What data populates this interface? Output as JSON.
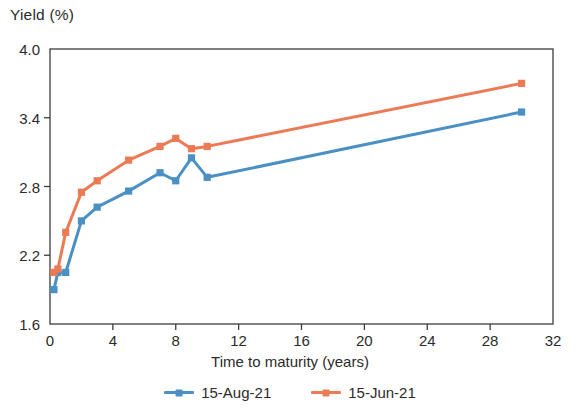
{
  "chart_data": {
    "type": "line",
    "title": "Yield (%)",
    "xlabel": "Time to maturity (years)",
    "ylabel": "Yield (%)",
    "xlim": [
      0,
      32
    ],
    "ylim": [
      1.6,
      4.0
    ],
    "xticks": [
      0,
      4,
      8,
      12,
      16,
      20,
      24,
      28,
      32
    ],
    "yticks": [
      1.6,
      2.2,
      2.8,
      3.4,
      4.0
    ],
    "xtick_labels": [
      "0",
      "4",
      "8",
      "12",
      "16",
      "20",
      "24",
      "28",
      "32"
    ],
    "ytick_labels": [
      "1.6",
      "2.2",
      "2.8",
      "3.4",
      "4.0"
    ],
    "grid": false,
    "legend_position": "bottom",
    "series": [
      {
        "name": "15-Aug-21",
        "color": "#4a90c4",
        "marker": "square",
        "x": [
          0.25,
          0.5,
          1,
          2,
          3,
          5,
          7,
          8,
          9,
          10,
          30
        ],
        "values": [
          1.9,
          2.05,
          2.05,
          2.5,
          2.62,
          2.76,
          2.92,
          2.85,
          3.05,
          2.88,
          3.45
        ]
      },
      {
        "name": "15-Jun-21",
        "color": "#ec7a55",
        "marker": "square",
        "x": [
          0.25,
          0.5,
          1,
          2,
          3,
          5,
          7,
          8,
          9,
          10,
          30
        ],
        "values": [
          2.05,
          2.08,
          2.4,
          2.75,
          2.85,
          3.03,
          3.15,
          3.22,
          3.13,
          3.15,
          3.7
        ]
      }
    ]
  },
  "legend": {
    "items": [
      {
        "label": "15-Aug-21",
        "color": "#4a90c4"
      },
      {
        "label": "15-Jun-21",
        "color": "#ec7a55"
      }
    ]
  },
  "axes": {
    "frame_color": "#3c3c3c"
  }
}
